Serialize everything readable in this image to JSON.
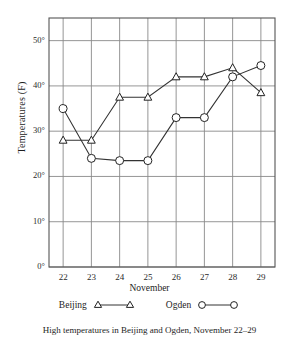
{
  "chart_data": {
    "type": "line",
    "title": "",
    "caption": "High temperatures in Beijing and Ogden, November 22–29",
    "xlabel": "November",
    "ylabel": "Temperatures (F)",
    "x": [
      22,
      23,
      24,
      25,
      26,
      27,
      28,
      29
    ],
    "categories": [
      "22",
      "23",
      "24",
      "25",
      "26",
      "27",
      "28",
      "29"
    ],
    "xtick_labels": [
      "22",
      "23",
      "24",
      "25",
      "26",
      "27",
      "28",
      "29"
    ],
    "ytick_labels": [
      "0°",
      "10°",
      "20°",
      "30°",
      "40°",
      "50°"
    ],
    "ytick_values": [
      0,
      10,
      20,
      30,
      40,
      50
    ],
    "ylim": [
      0,
      55
    ],
    "xlim": [
      21.5,
      29.5
    ],
    "grid": true,
    "legend_position": "bottom",
    "series": [
      {
        "name": "Beijing",
        "marker": "triangle",
        "color": "#333333",
        "values": [
          28,
          28,
          37.5,
          37.5,
          42,
          42,
          44,
          38.5
        ]
      },
      {
        "name": "Ogden",
        "marker": "circle",
        "color": "#333333",
        "values": [
          35,
          24,
          23.5,
          23.5,
          33,
          33,
          42,
          44.5
        ]
      }
    ]
  },
  "legend": {
    "beijing_label": "Beijing",
    "ogden_label": "Ogden"
  },
  "axes": {
    "x_title": "November",
    "y_title": "Temperatures (F)"
  },
  "colors": {
    "line": "#333333",
    "grid": "#8a8a8a",
    "axis": "#555555",
    "background": "#ffffff"
  }
}
